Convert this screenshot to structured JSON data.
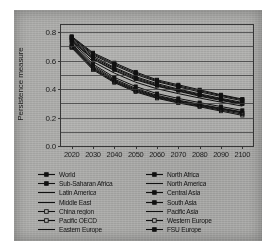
{
  "chart_data": {
    "type": "line",
    "title": "",
    "xlabel": "",
    "ylabel": "Persistence measure",
    "x": [
      2020,
      2030,
      2040,
      2050,
      2060,
      2070,
      2080,
      2090,
      2100
    ],
    "xlim": [
      2015,
      2105
    ],
    "ylim": [
      0.0,
      0.85
    ],
    "yticks": [
      0.0,
      0.2,
      0.4,
      0.6,
      0.8
    ],
    "ytick_labels": [
      "0.0",
      "0.2",
      "0.4",
      "0.6",
      "0.8"
    ],
    "xtick_labels": [
      "2020",
      "2030",
      "2040",
      "2050",
      "2060",
      "2070",
      "2080",
      "2090",
      "2100"
    ],
    "gridlines": [
      0.1,
      0.2,
      0.3,
      0.4,
      0.5,
      0.6,
      0.7,
      0.8
    ],
    "grid": true,
    "legend_position": "below-plot",
    "legend_columns": 2,
    "line_color": "#111111",
    "series": [
      {
        "name": "World",
        "marker": "filled-square",
        "values": [
          0.745,
          0.62,
          0.545,
          0.48,
          0.43,
          0.395,
          0.36,
          0.33,
          0.3
        ]
      },
      {
        "name": "Sub-Saharan Africa",
        "marker": "filled-square",
        "values": [
          0.77,
          0.655,
          0.585,
          0.52,
          0.465,
          0.43,
          0.395,
          0.36,
          0.33
        ]
      },
      {
        "name": "Latin America",
        "marker": "line",
        "values": [
          0.735,
          0.61,
          0.53,
          0.465,
          0.42,
          0.385,
          0.35,
          0.32,
          0.292
        ]
      },
      {
        "name": "Middle East",
        "marker": "line",
        "values": [
          0.752,
          0.63,
          0.552,
          0.487,
          0.438,
          0.4,
          0.366,
          0.335,
          0.306
        ]
      },
      {
        "name": "China region",
        "marker": "open-square",
        "values": [
          0.7,
          0.548,
          0.455,
          0.392,
          0.345,
          0.312,
          0.285,
          0.258,
          0.232
        ]
      },
      {
        "name": "Pacific OECD",
        "marker": "open-square",
        "values": [
          0.69,
          0.535,
          0.445,
          0.38,
          0.335,
          0.302,
          0.275,
          0.245,
          0.215
        ]
      },
      {
        "name": "Eastern Europe",
        "marker": "line",
        "values": [
          0.712,
          0.565,
          0.47,
          0.405,
          0.356,
          0.322,
          0.294,
          0.266,
          0.24
        ]
      },
      {
        "name": "North Africa",
        "marker": "filled-square",
        "values": [
          0.76,
          0.64,
          0.568,
          0.503,
          0.452,
          0.415,
          0.38,
          0.348,
          0.318
        ]
      },
      {
        "name": "North America",
        "marker": "line",
        "values": [
          0.706,
          0.556,
          0.462,
          0.398,
          0.35,
          0.317,
          0.289,
          0.262,
          0.236
        ]
      },
      {
        "name": "Central Asia",
        "marker": "filled-square",
        "values": [
          0.74,
          0.612,
          0.536,
          0.472,
          0.424,
          0.389,
          0.355,
          0.325,
          0.296
        ]
      },
      {
        "name": "South Asia",
        "marker": "filled-square",
        "values": [
          0.765,
          0.648,
          0.576,
          0.512,
          0.458,
          0.422,
          0.388,
          0.355,
          0.325
        ]
      },
      {
        "name": "Pacific Asia",
        "marker": "line",
        "values": [
          0.728,
          0.592,
          0.512,
          0.448,
          0.402,
          0.368,
          0.337,
          0.308,
          0.28
        ]
      },
      {
        "name": "Western Europe",
        "marker": "open-square",
        "values": [
          0.696,
          0.542,
          0.45,
          0.386,
          0.34,
          0.307,
          0.28,
          0.252,
          0.224
        ]
      },
      {
        "name": "FSU Europe",
        "marker": "filled-square",
        "values": [
          0.718,
          0.575,
          0.482,
          0.418,
          0.368,
          0.334,
          0.305,
          0.277,
          0.25
        ]
      }
    ]
  }
}
